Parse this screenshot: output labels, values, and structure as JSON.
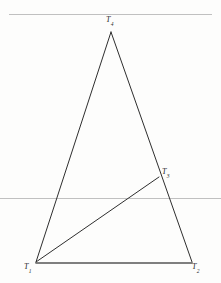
{
  "figure": {
    "background_color": "#fdfdfc",
    "stroke_color": "#2e2e2e",
    "rule_color": "#b9b9b9",
    "base_color": "#555555",
    "labels": {
      "apex": {
        "base": "T",
        "sub": "4"
      },
      "side_point": {
        "base": "T",
        "sub": "3"
      },
      "bottom_left": {
        "base": "T",
        "sub": "1"
      },
      "bottom_right": {
        "base": "T",
        "sub": "2"
      }
    }
  },
  "chart_data": {
    "type": "scatter",
    "xlabel": "",
    "ylabel": "",
    "xlim": [
      0,
      221
    ],
    "ylim": [
      283,
      0
    ],
    "grid": false,
    "legend": "none",
    "points": [
      {
        "name": "T1",
        "label": "T",
        "subscript": "1",
        "x": 36,
        "y": 262
      },
      {
        "name": "T2",
        "label": "T",
        "subscript": "2",
        "x": 192,
        "y": 262
      },
      {
        "name": "T3",
        "label": "T",
        "subscript": "3",
        "x": 159,
        "y": 177
      },
      {
        "name": "T4",
        "label": "T",
        "subscript": "4",
        "x": 111,
        "y": 32
      }
    ],
    "segments": [
      {
        "name": "left-side",
        "from": "T1",
        "to": "T4",
        "x1": 36,
        "y1": 262,
        "x2": 111,
        "y2": 32,
        "width": 1.0,
        "color": "#2e2e2e"
      },
      {
        "name": "right-side",
        "from": "T4",
        "to": "T2",
        "x1": 111,
        "y1": 32,
        "x2": 192,
        "y2": 262,
        "width": 1.0,
        "color": "#2e2e2e"
      },
      {
        "name": "base",
        "from": "T1",
        "to": "T2",
        "x1": 36,
        "y1": 263,
        "x2": 192,
        "y2": 263,
        "width": 1.6,
        "color": "#555555"
      },
      {
        "name": "cevian",
        "from": "T1",
        "to": "T3",
        "x1": 36,
        "y1": 262,
        "x2": 159,
        "y2": 177,
        "width": 1.0,
        "color": "#2e2e2e"
      }
    ],
    "rules": [
      {
        "name": "top-rule",
        "y": 14,
        "x1": 9,
        "x2": 212,
        "color": "#b9b9b9",
        "width": 0.9
      },
      {
        "name": "middle-rule",
        "y": 198,
        "x1": 0,
        "x2": 221,
        "color": "#b9b9b9",
        "width": 0.9
      }
    ]
  }
}
